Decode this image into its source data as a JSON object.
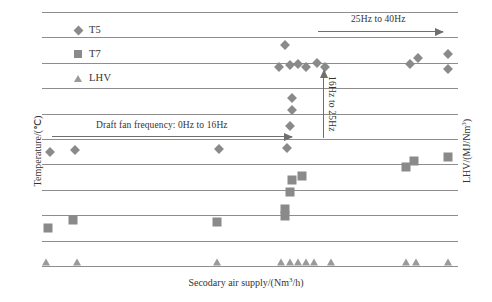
{
  "chart_data": {
    "type": "scatter",
    "title": "",
    "xlabel": "Secodary air supply/(Nm3/h)",
    "ylabel_left": "Temperature/(℃)",
    "ylabel_right": "LHV/(MJ/Nm3)",
    "grid": true,
    "gridline_count": 11,
    "legend_position": "top-left-inside",
    "legend": [
      {
        "label": "T5",
        "marker": "diamond",
        "color": "#8a8a8a"
      },
      {
        "label": "T7",
        "marker": "square",
        "color": "#8a8a8a"
      },
      {
        "label": "LHV",
        "marker": "triangle",
        "color": "#9a9a9a"
      }
    ],
    "series": [
      {
        "name": "T5",
        "marker": "diamond",
        "axis": "left",
        "points": [
          {
            "xp": 2.0,
            "yp": 55.0
          },
          {
            "xp": 8.0,
            "yp": 54.5
          },
          {
            "xp": 42.5,
            "yp": 54.0
          },
          {
            "xp": 58.5,
            "yp": 13.0
          },
          {
            "xp": 57.0,
            "yp": 21.5
          },
          {
            "xp": 59.5,
            "yp": 21.0
          },
          {
            "xp": 61.5,
            "yp": 20.5
          },
          {
            "xp": 63.5,
            "yp": 21.5
          },
          {
            "xp": 66.0,
            "yp": 20.0
          },
          {
            "xp": 68.0,
            "yp": 21.5
          },
          {
            "xp": 60.0,
            "yp": 34.0
          },
          {
            "xp": 60.0,
            "yp": 38.5
          },
          {
            "xp": 59.5,
            "yp": 45.0
          },
          {
            "xp": 59.0,
            "yp": 53.5
          },
          {
            "xp": 88.5,
            "yp": 20.5
          },
          {
            "xp": 90.5,
            "yp": 18.0
          },
          {
            "xp": 97.5,
            "yp": 16.5
          },
          {
            "xp": 97.5,
            "yp": 22.5
          }
        ]
      },
      {
        "name": "T7",
        "marker": "square",
        "axis": "left",
        "points": [
          {
            "xp": 1.5,
            "yp": 85.0
          },
          {
            "xp": 7.5,
            "yp": 82.0
          },
          {
            "xp": 42.0,
            "yp": 82.5
          },
          {
            "xp": 60.0,
            "yp": 66.0
          },
          {
            "xp": 62.5,
            "yp": 64.5
          },
          {
            "xp": 59.5,
            "yp": 71.0
          },
          {
            "xp": 58.5,
            "yp": 77.5
          },
          {
            "xp": 58.5,
            "yp": 80.5
          },
          {
            "xp": 87.5,
            "yp": 61.0
          },
          {
            "xp": 89.5,
            "yp": 58.5
          },
          {
            "xp": 97.5,
            "yp": 57.0
          }
        ]
      },
      {
        "name": "LHV",
        "marker": "triangle",
        "axis": "right",
        "points": [
          {
            "xp": 1.0,
            "yp": 98.5
          },
          {
            "xp": 8.5,
            "yp": 98.5
          },
          {
            "xp": 42.0,
            "yp": 98.5
          },
          {
            "xp": 57.5,
            "yp": 98.5
          },
          {
            "xp": 59.5,
            "yp": 98.5
          },
          {
            "xp": 61.5,
            "yp": 98.5
          },
          {
            "xp": 63.5,
            "yp": 98.5
          },
          {
            "xp": 65.5,
            "yp": 98.5
          },
          {
            "xp": 69.5,
            "yp": 98.5
          },
          {
            "xp": 87.5,
            "yp": 98.5
          },
          {
            "xp": 90.0,
            "yp": 98.5
          },
          {
            "xp": 97.5,
            "yp": 98.5
          }
        ]
      }
    ],
    "annotations": [
      {
        "name": "draft-fan-range",
        "text": "Draft fan frequency: 0Hz to 16Hz",
        "direction": "right"
      },
      {
        "name": "mid-frequency-range",
        "text": "16Hz to 25Hz",
        "direction": "up"
      },
      {
        "name": "high-frequency-range",
        "text": "25Hz to 40Hz",
        "direction": "right"
      }
    ]
  },
  "axes": {
    "x_title_prefix": "Secodary air supply/(Nm",
    "x_title_sup": "3",
    "x_title_suffix": "/h)",
    "y_left_title": "Temperature/(℃)",
    "y_right_prefix": "LHV/(MJ/Nm",
    "y_right_sup": "3",
    "y_right_suffix": ")"
  },
  "annotations": {
    "draft_fan": "Draft fan frequency: 0Hz to 16Hz",
    "mid_range": "16Hz to 25Hz",
    "high_range": "25Hz to 40Hz"
  },
  "legend": {
    "t5": "T5",
    "t7": "T7",
    "lhv": "LHV"
  }
}
